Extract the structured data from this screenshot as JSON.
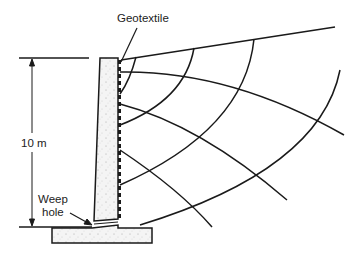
{
  "diagram": {
    "labels": {
      "geotextile": "Geotextile",
      "height": "10 m",
      "weep_hole_line1": "Weep",
      "weep_hole_line2": "hole"
    },
    "components": [
      "retaining-wall",
      "base-slab",
      "geotextile-drain",
      "flow-lines",
      "equipotential-lines",
      "dimension-arrow",
      "ground-surface"
    ],
    "colors": {
      "line": "#1a1a1a",
      "concrete": "#f2f2f2"
    }
  }
}
